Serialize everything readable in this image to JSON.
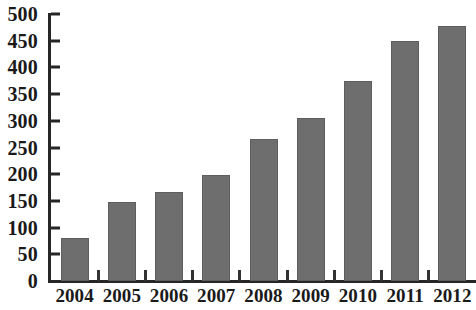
{
  "chart_data": {
    "type": "bar",
    "title": "",
    "subtitle": "",
    "xlabel": "",
    "ylabel": "",
    "categories": [
      "2004",
      "2005",
      "2006",
      "2007",
      "2008",
      "2009",
      "2010",
      "2011",
      "2012"
    ],
    "values": [
      80,
      148,
      167,
      199,
      266,
      305,
      374,
      449,
      478
    ],
    "ylim": [
      0,
      500
    ],
    "y_ticks": [
      0,
      50,
      100,
      150,
      200,
      250,
      300,
      350,
      400,
      450,
      500
    ],
    "y_tick_labels": [
      "0",
      "50",
      "100",
      "150",
      "200",
      "250",
      "300",
      "350",
      "400",
      "450",
      "500"
    ],
    "grid": false,
    "legend": false,
    "legend_position": "none",
    "bar_color": "#6e6e6e",
    "axis_color": "#262626",
    "background_color": "#ffffff"
  },
  "axes": {
    "y_axis_name": "y-axis",
    "x_axis_name": "x-axis"
  }
}
